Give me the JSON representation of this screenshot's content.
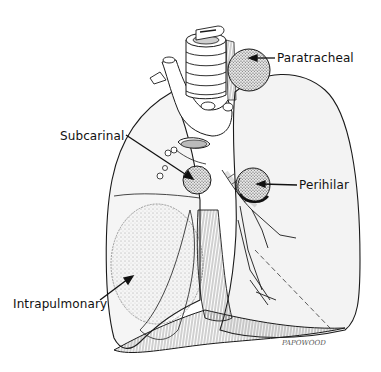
{
  "figure": {
    "type": "anatomical-illustration",
    "background_color": "#ffffff",
    "line_color": "#1a1a1a",
    "labels": [
      {
        "id": "paratracheal",
        "text": "Paratracheal",
        "x": 277,
        "y": 50
      },
      {
        "id": "subcarinal",
        "text": "Subcarinal",
        "x": 60,
        "y": 128
      },
      {
        "id": "perihilar",
        "text": "Perihilar",
        "x": 299,
        "y": 177
      },
      {
        "id": "intrapulmonary",
        "text": "Intrapulmonary",
        "x": 13,
        "y": 296
      }
    ],
    "signature": "PAPOWOOD"
  }
}
